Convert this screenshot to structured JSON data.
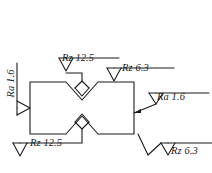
{
  "drawing": {
    "type": "engineering-surface-finish-drawing",
    "description": "Rectangular part outline with V-notches top-center and bottom-center, annotated with surface roughness symbols",
    "stroke_color": "#1a1a1a",
    "background_color": "#ffffff",
    "part": {
      "name": "notched-rectangular-part",
      "outline_left_x": 30,
      "outline_right_x": 134,
      "outline_top_y": 82,
      "outline_bottom_y": 134
    },
    "annotations": [
      {
        "id": "top-left",
        "parameter": "Rz",
        "value": "12.5",
        "label": "Rz 12.5",
        "symbol": "surface-roughness-triangle",
        "target": "top-notch"
      },
      {
        "id": "top-right",
        "parameter": "Rz",
        "value": "6.3",
        "label": "Rz 6.3",
        "symbol": "surface-roughness-triangle",
        "target": "top-edge"
      },
      {
        "id": "left",
        "parameter": "Ra",
        "value": "1.6",
        "label": "Ra 1.6",
        "symbol": "surface-roughness-triangle",
        "target": "left-edge",
        "rotated": "vertical"
      },
      {
        "id": "right",
        "parameter": "Ra",
        "value": "1.6",
        "label": "Ra 1.6",
        "symbol": "surface-roughness-triangle",
        "target": "right-edge"
      },
      {
        "id": "bottom-left",
        "parameter": "Rz",
        "value": "12.5",
        "label": "Rz 12.5",
        "symbol": "surface-roughness-triangle",
        "target": "bottom-notch"
      },
      {
        "id": "bottom-right",
        "parameter": "Rz",
        "value": "6.3",
        "label": "Rz 6.3",
        "symbol": "surface-roughness-triangle",
        "target": "bottom-edge"
      }
    ]
  },
  "labels": {
    "top_left": "Rz 12.5",
    "top_right": "Rz 6.3",
    "left": "Ra 1.6",
    "right": "Ra 1.6",
    "bottom_left": "Rz 12.5",
    "bottom_right": "Rz 6.3"
  }
}
